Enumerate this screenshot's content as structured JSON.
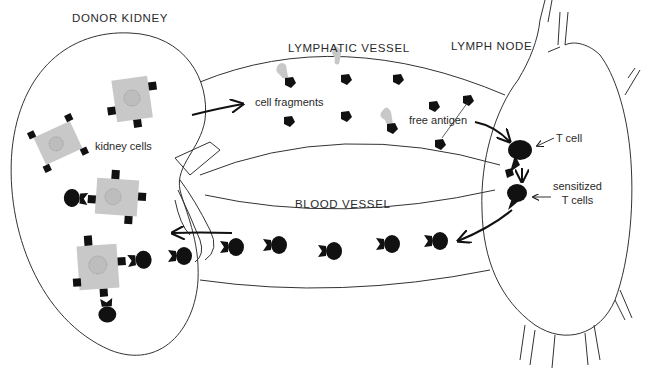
{
  "diagram": {
    "title_regions": {
      "donor_kidney": "DONOR KIDNEY",
      "lymphatic_vessel": "LYMPHATIC VESSEL",
      "lymph_node": "LYMPH NODE",
      "blood_vessel": "BLOOD VESSEL"
    },
    "annotations": {
      "kidney_cells": "kidney cells",
      "cell_fragments": "cell fragments",
      "free_antigen": "free antigen",
      "t_cell": "T cell",
      "sensitized_line1": "sensitized",
      "sensitized_line2": "T cells"
    },
    "colors": {
      "outline": "#2a2a2a",
      "cell_gray": "#c8c8c8",
      "antigen_black": "#111111",
      "background": "#ffffff"
    },
    "flow": [
      "kidney cells",
      "cell fragments",
      "free antigen",
      "T cell",
      "sensitized T cells",
      "blood vessel",
      "kidney cells"
    ]
  }
}
